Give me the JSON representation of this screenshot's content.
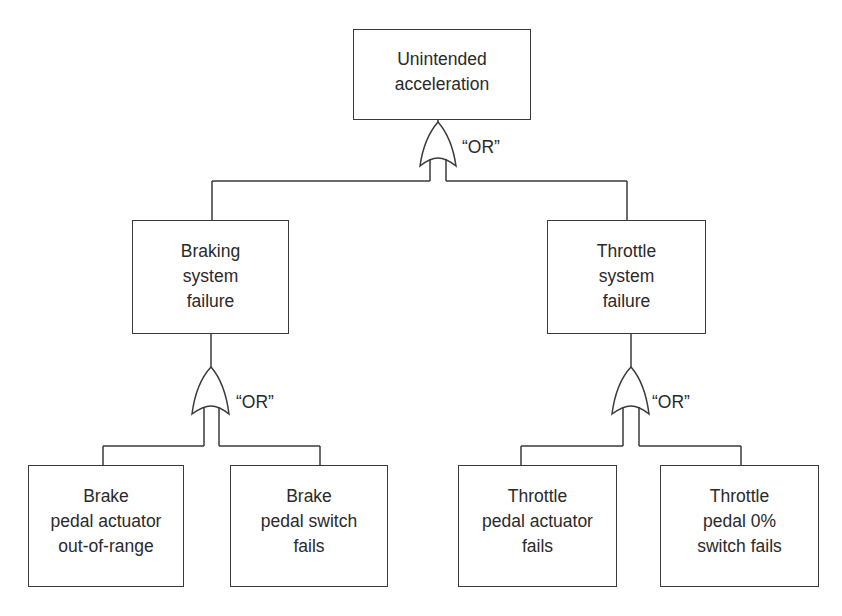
{
  "diagram": {
    "type": "fault-tree",
    "top_event": {
      "lines": [
        "Unintended",
        "acceleration"
      ]
    },
    "top_gate": {
      "label": "“OR”",
      "type": "OR"
    },
    "branches": [
      {
        "event": {
          "lines": [
            "Braking",
            "system",
            "failure"
          ]
        },
        "gate": {
          "label": "“OR”",
          "type": "OR"
        },
        "children": [
          {
            "lines": [
              "Brake",
              "pedal actuator",
              "out-of-range"
            ]
          },
          {
            "lines": [
              "Brake",
              "pedal switch",
              "fails"
            ]
          }
        ]
      },
      {
        "event": {
          "lines": [
            "Throttle",
            "system",
            "failure"
          ]
        },
        "gate": {
          "label": "“OR”",
          "type": "OR"
        },
        "children": [
          {
            "lines": [
              "Throttle",
              "pedal actuator",
              "fails"
            ]
          },
          {
            "lines": [
              "Throttle",
              "pedal 0%",
              "switch fails"
            ]
          }
        ]
      }
    ],
    "colors": {
      "stroke": "#3a3a3a",
      "text": "#2a2a2a",
      "background": "#ffffff"
    }
  }
}
